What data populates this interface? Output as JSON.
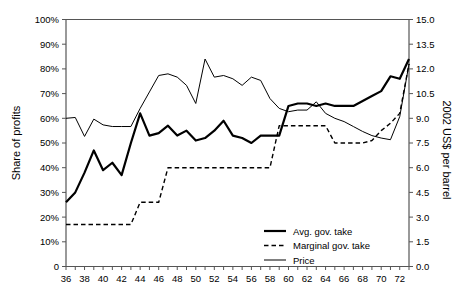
{
  "chart_data": {
    "type": "line",
    "title": "",
    "xlabel": "",
    "ylabel": "Share of profits",
    "y2label": "2002 US$ per barrel",
    "grid": false,
    "legend_position": "bottom-right",
    "xlim": [
      36,
      73
    ],
    "ylim": [
      0,
      100
    ],
    "y2lim": [
      0.0,
      15.0
    ],
    "x_tick_labels": [
      "36",
      "38",
      "40",
      "42",
      "44",
      "46",
      "48",
      "50",
      "52",
      "54",
      "56",
      "58",
      "60",
      "62",
      "64",
      "66",
      "68",
      "70",
      "72"
    ],
    "x_tick_values": [
      36,
      38,
      40,
      42,
      44,
      46,
      48,
      50,
      52,
      54,
      56,
      58,
      60,
      62,
      64,
      66,
      68,
      70,
      72
    ],
    "y_tick_labels": [
      "0",
      "10%",
      "20%",
      "30%",
      "40%",
      "50%",
      "60%",
      "70%",
      "80%",
      "90%",
      "100%"
    ],
    "y_tick_values": [
      0,
      10,
      20,
      30,
      40,
      50,
      60,
      70,
      80,
      90,
      100
    ],
    "y2_tick_labels": [
      "0.0",
      "1.5",
      "3.0",
      "4.5",
      "6.0",
      "7.5",
      "9.0",
      "10.5",
      "12.0",
      "13.5",
      "15.0"
    ],
    "y2_tick_values": [
      0.0,
      1.5,
      3.0,
      4.5,
      6.0,
      7.5,
      9.0,
      10.5,
      12.0,
      13.5,
      15.0
    ],
    "x": [
      36,
      37,
      38,
      39,
      40,
      41,
      42,
      43,
      44,
      45,
      46,
      47,
      48,
      49,
      50,
      51,
      52,
      53,
      54,
      55,
      56,
      57,
      58,
      59,
      60,
      61,
      62,
      63,
      64,
      65,
      66,
      67,
      68,
      69,
      70,
      71,
      72,
      73
    ],
    "series": [
      {
        "name": "Avg. gov. take",
        "axis": "left",
        "style": "solid",
        "width": 2.2,
        "color": "#000000",
        "values": [
          26,
          30,
          38,
          47,
          39,
          42,
          37,
          50,
          62,
          53,
          54,
          57,
          53,
          55,
          51,
          52,
          55,
          59,
          53,
          52,
          50,
          53,
          53,
          53,
          65,
          66,
          66,
          65,
          66,
          65,
          65,
          65,
          67,
          69,
          71,
          77,
          76,
          84
        ]
      },
      {
        "name": "Marginal gov. take",
        "axis": "left",
        "style": "dashed",
        "width": 1.4,
        "color": "#000000",
        "values": [
          17,
          17,
          17,
          17,
          17,
          17,
          17,
          17,
          26,
          26,
          26,
          40,
          40,
          40,
          40,
          40,
          40,
          40,
          40,
          40,
          40,
          40,
          40,
          57,
          57,
          57,
          57,
          57,
          57,
          50,
          50,
          50,
          50,
          51,
          55,
          58,
          62,
          82
        ]
      },
      {
        "name": "Price",
        "axis": "right",
        "style": "solid",
        "width": 1.0,
        "color": "#000000",
        "values": [
          9.0,
          9.05,
          7.9,
          8.95,
          8.6,
          8.5,
          8.5,
          8.5,
          9.6,
          10.6,
          11.6,
          11.7,
          11.5,
          11.0,
          9.9,
          12.6,
          11.5,
          11.6,
          11.4,
          11.0,
          11.5,
          11.3,
          10.2,
          9.6,
          9.4,
          9.5,
          9.5,
          10.0,
          9.3,
          9.0,
          8.8,
          8.5,
          8.2,
          7.95,
          7.8,
          7.7,
          9.1,
          12.3
        ]
      }
    ],
    "legend": [
      {
        "label": "Avg. gov. take",
        "style": "solid",
        "width": 2.2
      },
      {
        "label": "Marginal gov. take",
        "style": "dashed",
        "width": 1.4
      },
      {
        "label": "Price",
        "style": "solid",
        "width": 1.0
      }
    ]
  }
}
